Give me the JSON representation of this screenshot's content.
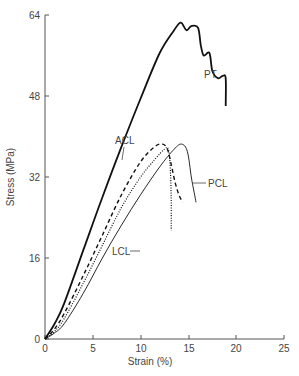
{
  "chart_data": {
    "type": "line",
    "title": "",
    "xlabel": "Strain (%)",
    "ylabel": "Stress (MPa)",
    "xlim": [
      0,
      25
    ],
    "ylim": [
      0,
      64
    ],
    "xticks": [
      0,
      5,
      10,
      15,
      20,
      25
    ],
    "yticks": [
      0,
      16,
      32,
      48,
      64
    ],
    "grid": false,
    "legend": "inline labels",
    "series": [
      {
        "name": "PT",
        "style": "solid-thick",
        "x": [
          0,
          1,
          2,
          4,
          6,
          8,
          10,
          12,
          13.5,
          14.2,
          14.8,
          15.3,
          16.0,
          16.3,
          16.6,
          17.2,
          17.5,
          18.1,
          18.6,
          18.9,
          18.9
        ],
        "y": [
          0,
          3,
          7,
          17.5,
          28,
          38,
          47.5,
          56.5,
          61,
          62.5,
          61,
          61.8,
          61.5,
          58,
          56,
          56.5,
          53,
          51.5,
          52,
          51.5,
          46
        ]
      },
      {
        "name": "ACL",
        "style": "dashed",
        "x": [
          0,
          1,
          2,
          4,
          6,
          8,
          10,
          11.5,
          12.3,
          12.8,
          13.2,
          13.6,
          14.0,
          14.4
        ],
        "y": [
          0,
          2,
          5,
          12.5,
          20.5,
          28.5,
          35,
          38,
          38.5,
          37.5,
          34.5,
          31,
          28.5,
          27
        ]
      },
      {
        "name": "LCL",
        "style": "dotted",
        "x": [
          0,
          1,
          2,
          4,
          6,
          8,
          10,
          11.5,
          12.5,
          12.9,
          13.1,
          13.2,
          13.2
        ],
        "y": [
          0,
          1.5,
          4,
          11,
          18.5,
          26,
          32,
          35.5,
          37.5,
          37.5,
          34,
          28,
          21.5
        ]
      },
      {
        "name": "PCL",
        "style": "solid-thin",
        "x": [
          0,
          1,
          2,
          4,
          6,
          8,
          10,
          12,
          13.5,
          14.3,
          14.9,
          15.3,
          15.6,
          15.8
        ],
        "y": [
          0,
          1.2,
          3,
          9,
          16,
          22.5,
          28.5,
          34,
          37.5,
          38.5,
          37,
          32,
          29,
          27
        ]
      }
    ],
    "annotations": [
      {
        "text": "PT",
        "x": 16.3,
        "y": 58.5
      },
      {
        "text": "ACL",
        "x": 10.8,
        "y": 40
      },
      {
        "text": "PCL",
        "x": 17,
        "y": 29
      },
      {
        "text": "LCL",
        "x": 10.5,
        "y": 17.5
      }
    ]
  },
  "labels": {
    "xlabel": "Strain (%)",
    "ylabel": "Stress (MPa)",
    "xticks": [
      "0",
      "5",
      "10",
      "15",
      "20",
      "25"
    ],
    "yticks": [
      "0",
      "16",
      "32",
      "48",
      "64"
    ],
    "pt": "PT",
    "acl": "ACL",
    "pcl": "PCL",
    "lcl": "LCL"
  }
}
